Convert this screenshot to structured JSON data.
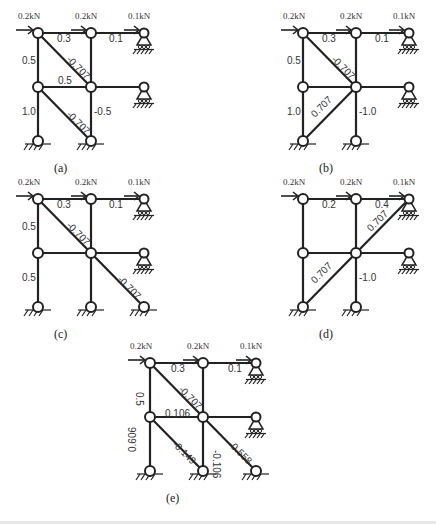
{
  "figure": {
    "loads": [
      "0.2kN",
      "0.2kN",
      "0.1kN"
    ],
    "diagrams": [
      {
        "id": "a",
        "caption": "(a)",
        "origin": [
          38,
          33
        ],
        "diagonals": [
          [
            0,
            0,
            1,
            1
          ],
          [
            0,
            1,
            1,
            2
          ]
        ],
        "bottom_right_support": false,
        "labels": [
          {
            "text": "0.3",
            "x": 57,
            "y": 42,
            "rot": 0
          },
          {
            "text": "0.1",
            "x": 109,
            "y": 42,
            "rot": 0
          },
          {
            "text": "-0.707",
            "x": 66,
            "y": 60,
            "rot": 45
          },
          {
            "text": "0.5",
            "x": 22,
            "y": 64,
            "rot": 0
          },
          {
            "text": "0.5",
            "x": 58,
            "y": 84,
            "rot": 0
          },
          {
            "text": "-0.707",
            "x": 66,
            "y": 115,
            "rot": 45
          },
          {
            "text": "1.0",
            "x": 22,
            "y": 115,
            "rot": 0
          },
          {
            "text": "-0.5",
            "x": 94,
            "y": 115,
            "rot": 0
          }
        ]
      },
      {
        "id": "b",
        "caption": "(b)",
        "origin": [
          303,
          33
        ],
        "diagonals": [
          [
            0,
            0,
            1,
            1
          ],
          [
            0,
            2,
            1,
            1
          ]
        ],
        "bottom_right_support": false,
        "labels": [
          {
            "text": "0.3",
            "x": 322,
            "y": 42,
            "rot": 0
          },
          {
            "text": "0.1",
            "x": 375,
            "y": 42,
            "rot": 0
          },
          {
            "text": "-0.707",
            "x": 331,
            "y": 60,
            "rot": 45
          },
          {
            "text": "0.5",
            "x": 287,
            "y": 64,
            "rot": 0
          },
          {
            "text": "0.707",
            "x": 315,
            "y": 118,
            "rot": -45
          },
          {
            "text": "1.0",
            "x": 287,
            "y": 115,
            "rot": 0
          },
          {
            "text": "-1.0",
            "x": 359,
            "y": 115,
            "rot": 0
          }
        ]
      },
      {
        "id": "c",
        "caption": "(c)",
        "origin": [
          38,
          199
        ],
        "diagonals": [
          [
            0,
            0,
            2,
            2
          ]
        ],
        "bottom_right_support": true,
        "labels": [
          {
            "text": "0.3",
            "x": 57,
            "y": 208,
            "rot": 0
          },
          {
            "text": "0.1",
            "x": 109,
            "y": 208,
            "rot": 0
          },
          {
            "text": "-0.707",
            "x": 66,
            "y": 226,
            "rot": 45
          },
          {
            "text": "0.5",
            "x": 22,
            "y": 230,
            "rot": 0
          },
          {
            "text": "-0.707",
            "x": 117,
            "y": 280,
            "rot": 45
          },
          {
            "text": "0.5",
            "x": 22,
            "y": 281,
            "rot": 0
          }
        ]
      },
      {
        "id": "d",
        "caption": "(d)",
        "origin": [
          303,
          199
        ],
        "diagonals": [
          [
            0,
            2,
            2,
            0
          ]
        ],
        "bottom_right_support": false,
        "labels": [
          {
            "text": "0.2",
            "x": 322,
            "y": 208,
            "rot": 0
          },
          {
            "text": "0.4",
            "x": 375,
            "y": 208,
            "rot": 0
          },
          {
            "text": "0.707",
            "x": 371,
            "y": 232,
            "rot": -45
          },
          {
            "text": "0.707",
            "x": 315,
            "y": 284,
            "rot": -45
          },
          {
            "text": "-1.0",
            "x": 359,
            "y": 281,
            "rot": 0
          }
        ]
      },
      {
        "id": "e",
        "caption": "(e)",
        "origin": [
          150,
          363
        ],
        "diagonals": [
          [
            0,
            0,
            1,
            1
          ],
          [
            0,
            1,
            1,
            2
          ],
          [
            1,
            1,
            2,
            2
          ]
        ],
        "bottom_right_support": true,
        "labels": [
          {
            "text": "0.3",
            "x": 171,
            "y": 372,
            "rot": 0
          },
          {
            "text": "0.1",
            "x": 228,
            "y": 372,
            "rot": 0
          },
          {
            "text": "-0.707",
            "x": 178,
            "y": 390,
            "rot": 45
          },
          {
            "text": "0.5",
            "x": 136,
            "y": 392,
            "rot": 90
          },
          {
            "text": "0.106",
            "x": 165,
            "y": 417,
            "rot": 0
          },
          {
            "text": "0.606",
            "x": 136,
            "y": 452,
            "rot": -90
          },
          {
            "text": "-0.149",
            "x": 172,
            "y": 445,
            "rot": 45
          },
          {
            "text": "-0.106",
            "x": 213,
            "y": 450,
            "rot": 90
          },
          {
            "text": "-0.558",
            "x": 228,
            "y": 445,
            "rot": 45
          }
        ]
      }
    ]
  }
}
